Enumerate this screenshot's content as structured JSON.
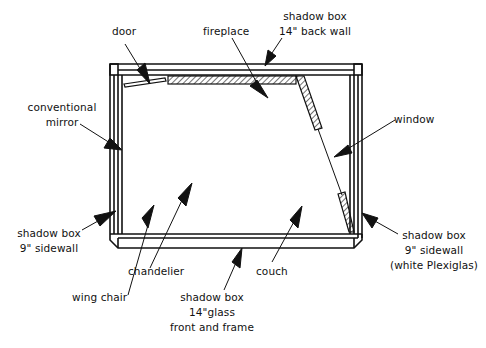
{
  "diagram": {
    "type": "plan-view schematic",
    "colors": {
      "line": "#111111",
      "background": "#ffffff"
    },
    "labels": {
      "door": "door",
      "fireplace": "fireplace",
      "back_wall": {
        "line1": "shadow box",
        "line2": "14\" back wall"
      },
      "mirror": {
        "line1": "conventional",
        "line2": "mirror"
      },
      "window": "window",
      "left_sidewall": {
        "line1": "shadow box",
        "line2": "9\" sidewall"
      },
      "right_sidewall": {
        "line1": "shadow box",
        "line2": "9\" sidewall",
        "line3": "(white Plexiglas)"
      },
      "chandelier": "chandelier",
      "wing_chair": "wing chair",
      "couch": "couch",
      "front": {
        "line1": "shadow box",
        "line2": "14\"glass",
        "line3": "front and frame"
      }
    }
  }
}
